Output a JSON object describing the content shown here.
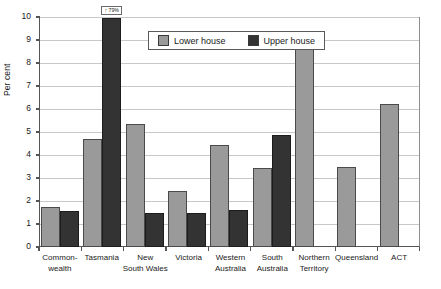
{
  "chart_data": {
    "type": "bar",
    "title": "",
    "xlabel": "",
    "ylabel": "Per cent",
    "ylim": [
      0,
      10
    ],
    "ytick_step": 1,
    "grid": true,
    "legend_position": "inside-top-center",
    "categories": [
      "Common-wealth",
      "Tasmania",
      "New South Wales",
      "Victoria",
      "Western Australia",
      "South Australia",
      "Northern Territory",
      "Queensland",
      "ACT"
    ],
    "category_lines": [
      [
        "Common-",
        "wealth"
      ],
      [
        "Tasmania"
      ],
      [
        "New",
        "South Wales"
      ],
      [
        "Victoria"
      ],
      [
        "Western",
        "Australia"
      ],
      [
        "South",
        "Australia"
      ],
      [
        "Northern",
        "Territory"
      ],
      [
        "Queensland"
      ],
      [
        "ACT"
      ]
    ],
    "series": [
      {
        "name": "Lower house",
        "color": "#9a9a9a",
        "values": [
          1.75,
          4.7,
          5.35,
          2.45,
          4.45,
          3.45,
          8.6,
          3.5,
          6.2
        ]
      },
      {
        "name": "Upper house",
        "color": "#333333",
        "values": [
          1.55,
          9.95,
          1.5,
          1.5,
          1.6,
          4.85,
          null,
          null,
          null
        ]
      }
    ],
    "ytick_labels": [
      "10",
      "9",
      "8",
      "7",
      "6",
      "5",
      "4",
      "3",
      "2",
      "1",
      "0"
    ],
    "annotations": [
      {
        "category": "Tasmania",
        "series": "Upper house",
        "text": "↑ 79%",
        "note": "bar clipped at axis maximum"
      }
    ]
  },
  "legend": {
    "items": [
      {
        "label": "Lower house",
        "swatch": "lower"
      },
      {
        "label": "Upper house",
        "swatch": "upper"
      }
    ]
  }
}
